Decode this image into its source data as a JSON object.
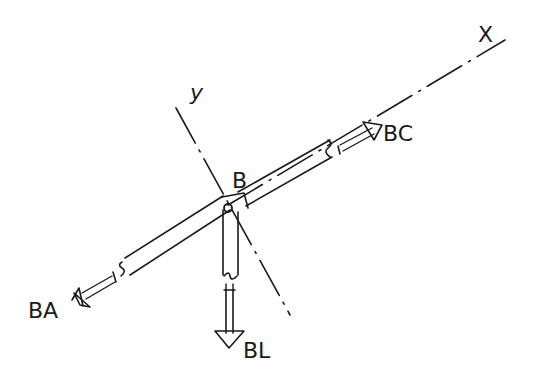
{
  "diagram": {
    "type": "free-body-diagram",
    "style": "hand-drawn sketch",
    "colors": {
      "ink": "#1a1a1a",
      "background": "#ffffff"
    },
    "axes": [
      {
        "id": "x",
        "label": "X",
        "style": "dash-dot"
      },
      {
        "id": "y",
        "label": "y",
        "style": "dash-dot"
      }
    ],
    "joint": {
      "label": "B"
    },
    "members": [
      {
        "id": "BA",
        "label": "BA",
        "direction": "lower-left along x-axis"
      },
      {
        "id": "BC",
        "label": "BC",
        "direction": "upper-right along x-axis"
      },
      {
        "id": "BL",
        "label": "BL",
        "direction": "vertical downward"
      }
    ]
  }
}
